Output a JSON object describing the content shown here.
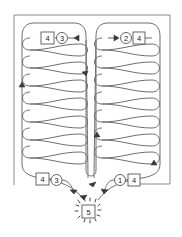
{
  "diagram": {
    "type": "flow-path-diagram",
    "nodes": {
      "top_left_box": "4",
      "top_left_circle": "3",
      "top_right_circle": "2",
      "top_right_box": "4",
      "bottom_left_box": "4",
      "bottom_left_circle": "3",
      "bottom_right_circle": "1",
      "bottom_right_box": "4",
      "exit_box": "5"
    },
    "lanes": [
      {
        "name": "left-lane",
        "coils": 7
      },
      {
        "name": "right-lane",
        "coils": 7
      }
    ],
    "colors": {
      "line": "#6e6e6e",
      "frame": "#8a8a8a",
      "background": "#ffffff"
    }
  }
}
